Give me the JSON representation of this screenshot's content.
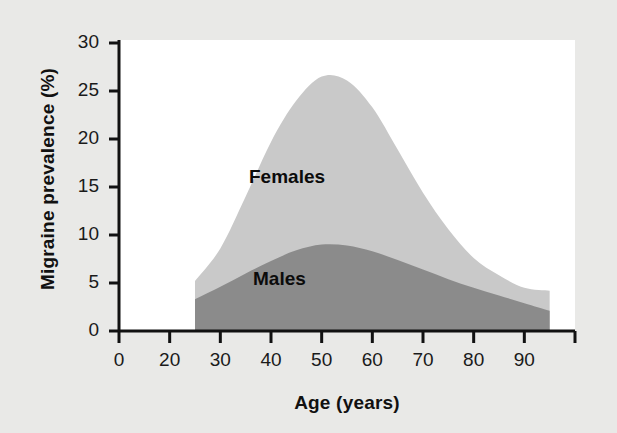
{
  "chart_data": {
    "type": "area",
    "stacked": true,
    "title": "",
    "subtitle": "",
    "xlabel": "Age (years)",
    "ylabel": "Migraine prevalence (%)",
    "xlim": [
      0,
      90
    ],
    "ylim": [
      0,
      30
    ],
    "grid": false,
    "legend_position": "inline-annotation",
    "x_tick_labels": [
      "0",
      "20",
      "30",
      "40",
      "50",
      "60",
      "70",
      "80",
      "90"
    ],
    "x_tick_values": [
      0,
      10,
      20,
      30,
      40,
      50,
      60,
      70,
      80,
      90
    ],
    "y_tick_labels": [
      "0",
      "5",
      "10",
      "15",
      "20",
      "25",
      "30"
    ],
    "y_tick_values": [
      0,
      5,
      10,
      15,
      20,
      25,
      30
    ],
    "x": [
      15,
      20,
      25,
      30,
      35,
      40,
      45,
      50,
      55,
      60,
      65,
      70,
      75,
      80,
      85
    ],
    "series": [
      {
        "name": "Males",
        "color": "#8b8b8b",
        "label": "Males",
        "values": [
          3.3,
          4.6,
          6.0,
          7.3,
          8.4,
          9.0,
          8.9,
          8.3,
          7.4,
          6.4,
          5.4,
          4.5,
          3.7,
          2.9,
          2.1
        ]
      },
      {
        "name": "Females",
        "color": "#c9c9c9",
        "label": "Females",
        "values": [
          1.9,
          4.0,
          8.0,
          12.4,
          15.6,
          17.5,
          17.2,
          15.0,
          11.5,
          8.0,
          5.2,
          3.1,
          2.1,
          1.6,
          2.1
        ]
      }
    ],
    "series_totals": {
      "note": "Females band is drawn stacked on top of Males; total curve values below",
      "females_total": [
        5.2,
        8.6,
        14.0,
        19.7,
        24.0,
        26.5,
        26.1,
        23.3,
        18.9,
        14.4,
        10.6,
        7.6,
        5.8,
        4.5,
        4.2
      ]
    },
    "annotations": [
      {
        "text": "Females",
        "x": 40,
        "y": 17
      },
      {
        "text": "Males",
        "x": 41,
        "y": 6
      }
    ]
  },
  "colors": {
    "background": "#e9e9e7",
    "plot_background": "#ffffff",
    "females_band": "#c9c9c9",
    "males_band": "#8b8b8b",
    "axis": "#111111",
    "text": "#111111"
  }
}
